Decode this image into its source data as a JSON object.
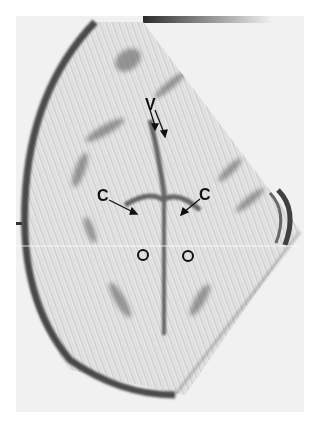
{
  "image": {
    "type": "ultrasound-sector-scan",
    "grayscale_bar": true,
    "labels": [
      {
        "text": "V",
        "x": 147,
        "y": 97
      },
      {
        "text": "C",
        "x": 97,
        "y": 188
      },
      {
        "text": "C",
        "x": 200,
        "y": 187
      }
    ],
    "markers": [
      {
        "symbol": "o",
        "x": 142,
        "y": 254
      },
      {
        "symbol": "o",
        "x": 187,
        "y": 255
      }
    ],
    "colors": {
      "background": "#ffffff",
      "tissue_dark": "#1f1f1f",
      "tissue_light": "#eeeeee"
    }
  }
}
